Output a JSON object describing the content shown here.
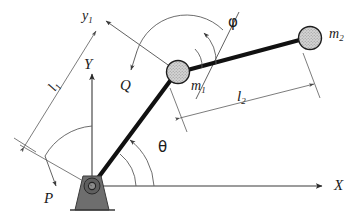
{
  "figure": {
    "background_color": "#ffffff",
    "line_color": "#111111",
    "thin_line_color": "#5a5a5a",
    "support_fill": "#6e6e6e",
    "mass_fill": "#cfcfcf"
  },
  "labels": {
    "axis_x": "X",
    "axis_y": "Y",
    "axis_y1": "y",
    "axis_y1_sub": "1",
    "mass1": "m",
    "mass1_sub": "1",
    "mass2": "m",
    "mass2_sub": "2",
    "length1": "l",
    "length1_sub": "1",
    "length2": "l",
    "length2_sub": "2",
    "torque_base": "P",
    "torque_joint": "Q",
    "angle_theta": "θ",
    "angle_phi": "φ"
  },
  "elements": {
    "origin_pivot": "revolute-joint-at-base",
    "joint_pivot": "revolute-joint-at-elbow",
    "end_mass": "point-mass-m2",
    "link1": "link-1",
    "link2": "link-2",
    "support": "ground-support-triangle"
  },
  "geometry": {
    "origin": [
      92,
      186
    ],
    "joint": [
      178,
      72
    ],
    "tip": [
      310,
      38
    ],
    "theta_deg": 53,
    "phi_deg": 15
  }
}
